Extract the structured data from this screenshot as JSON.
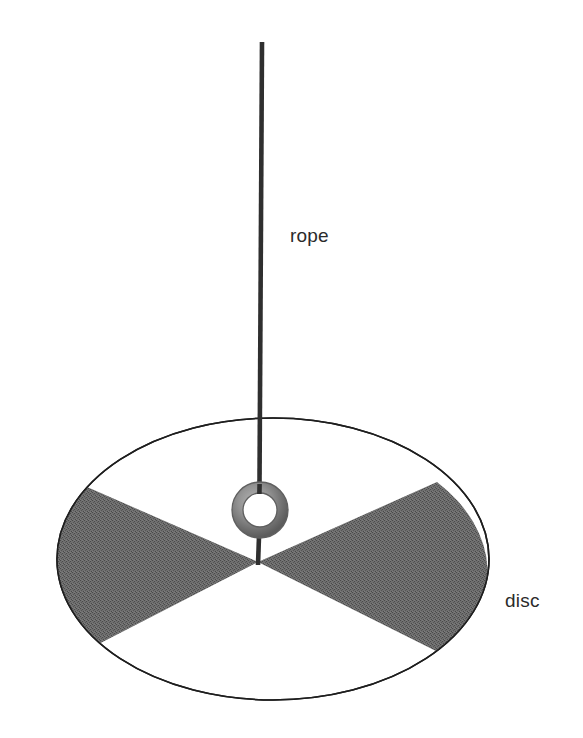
{
  "figure": {
    "background_color": "#ffffff",
    "width": 583,
    "height": 738
  },
  "labels": {
    "rope": "rope",
    "disc": "disc"
  },
  "colors": {
    "rope_stroke": "#2f2f2f",
    "disc_outline": "#1e1e1e",
    "sector_fill": "#6b6b6b",
    "sector_fill_dither_dark": "#4f4f4f",
    "ring_outer_stroke": "#6e6e6e",
    "ring_body": "#8c8c8c",
    "ring_inner_fill": "#ffffff",
    "label_text": "#2b2b2b"
  },
  "geometry": {
    "disc_ellipse": {
      "center_x": 273,
      "center_y": 559,
      "radius_x": 216,
      "radius_y": 141,
      "stroke_width": 1.6
    },
    "rope": {
      "top_x": 262,
      "top_y": 42,
      "bottom_x": 258,
      "bottom_y": 563,
      "stroke_width": 4.5
    },
    "ring": {
      "center_x": 260,
      "center_y": 510,
      "outer_radius": 28,
      "inner_radius": 17,
      "band_width": 11
    },
    "bowtie_vertex": {
      "x": 258,
      "y": 562
    },
    "left_sector": {
      "upper_contact_x": 78,
      "upper_contact_y": 483,
      "lower_contact_x": 85,
      "lower_contact_y": 651
    },
    "right_sector": {
      "upper_contact_x": 437,
      "upper_contact_y": 482,
      "lower_contact_x": 446,
      "lower_contact_y": 656
    }
  },
  "elements": [
    {
      "name": "rope",
      "kind": "line",
      "description": "vertical rope hanging from above"
    },
    {
      "name": "ring",
      "kind": "annulus",
      "description": "metal ring at disc center through which the rope passes"
    },
    {
      "name": "disc",
      "kind": "ellipse",
      "description": "circular disc seen in perspective as an ellipse"
    },
    {
      "name": "left-shaded-sector",
      "kind": "sector",
      "description": "shaded wedge on the left half of the disc"
    },
    {
      "name": "right-shaded-sector",
      "kind": "sector",
      "description": "shaded wedge on the right half of the disc"
    }
  ]
}
